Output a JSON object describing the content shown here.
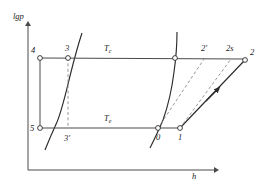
{
  "figure": {
    "type": "pressure-enthalpy-refrigeration-cycle",
    "axes": {
      "y_label": "lgp",
      "x_label": "h",
      "y_origin_px": 170,
      "x_origin_px": 28
    },
    "colors": {
      "line": "#4a4a4a",
      "curve": "#2b2b2b",
      "dashed": "#8a8a8a",
      "text": "#1a1a1a",
      "background": "#ffffff"
    },
    "isotherms": [
      {
        "name": "condensing-isotherm",
        "label": "T",
        "subscript": "c",
        "y_px": 58
      },
      {
        "name": "evaporating-isotherm",
        "label": "T",
        "subscript": "e",
        "y_px": 128
      }
    ],
    "points": [
      {
        "id": "4",
        "label": "4",
        "x_px": 40,
        "y_px": 58,
        "marker": true,
        "label_dx": -9,
        "label_dy": -12
      },
      {
        "id": "3",
        "label": "3",
        "x_px": 68,
        "y_px": 58,
        "marker": true,
        "label_dx": -3,
        "label_dy": -14
      },
      {
        "id": "tc_sat",
        "label": "",
        "x_px": 175,
        "y_px": 58,
        "marker": true,
        "label_dx": 0,
        "label_dy": 0
      },
      {
        "id": "2p",
        "label": "2'",
        "x_px": 205,
        "y_px": 58,
        "marker": false,
        "label_dx": -4,
        "label_dy": -14
      },
      {
        "id": "2s",
        "label": "2s",
        "x_px": 232,
        "y_px": 58,
        "marker": false,
        "label_dx": -6,
        "label_dy": -14
      },
      {
        "id": "2",
        "label": "2",
        "x_px": 245,
        "y_px": 60,
        "marker": true,
        "label_dx": 5,
        "label_dy": -12
      },
      {
        "id": "5",
        "label": "5",
        "x_px": 40,
        "y_px": 128,
        "marker": true,
        "label_dx": -10,
        "label_dy": -4
      },
      {
        "id": "3p",
        "label": "3'",
        "x_px": 68,
        "y_px": 128,
        "marker": false,
        "label_dx": -4,
        "label_dy": 10
      },
      {
        "id": "0",
        "label": "0",
        "x_px": 158,
        "y_px": 128,
        "marker": true,
        "label_dx": -2,
        "label_dy": 10
      },
      {
        "id": "1",
        "label": "1",
        "x_px": 180,
        "y_px": 128,
        "marker": true,
        "label_dx": -2,
        "label_dy": 10
      }
    ],
    "segments": {
      "top_isotherm": "4 - 3 - saturation - 2' - 2s - 2",
      "bottom_isotherm": "5 - 3' - 0 - 1",
      "left_vertical": "4 - 5",
      "compression_real": "1 - 2 (solid, arrow)",
      "compression_isentropic": "1 - 2s (dashed)",
      "compression_alt": "0 - 2' (dashed)",
      "throttle": "3 - 3' (dashed vertical)"
    }
  }
}
